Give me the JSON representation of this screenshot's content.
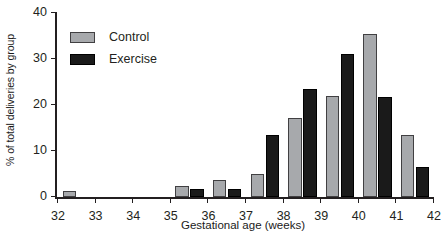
{
  "chart_data": {
    "type": "bar",
    "title": "",
    "subtitle": "",
    "xlabel": "Gestational age (weeks)",
    "ylabel": "% of total deliveries by group",
    "categories": [
      "32",
      "33",
      "34",
      "35",
      "36",
      "37",
      "38",
      "39",
      "40",
      "41"
    ],
    "x_tick_labels": [
      "32",
      "33",
      "34",
      "35",
      "36",
      "37",
      "38",
      "39",
      "40",
      "41",
      "42"
    ],
    "y_tick_labels": [
      "0",
      "10",
      "20",
      "30",
      "40"
    ],
    "y_ticks": [
      0,
      10,
      20,
      30,
      40
    ],
    "ylim": [
      0,
      40
    ],
    "xlim": [
      32,
      42
    ],
    "grid": false,
    "legend_position": "upper left",
    "series": [
      {
        "name": "Control",
        "color": "#a7a9ac",
        "values": [
          1.3,
          0,
          0,
          2.3,
          3.7,
          4.9,
          17.1,
          22.0,
          35.5,
          13.4
        ]
      },
      {
        "name": "Exercise",
        "color": "#1a1a1a",
        "values": [
          0,
          0,
          0,
          1.7,
          1.7,
          13.5,
          23.5,
          31.0,
          21.8,
          6.5
        ]
      }
    ]
  },
  "legend": {
    "items": [
      {
        "label": "Control",
        "color": "#a7a9ac"
      },
      {
        "label": "Exercise",
        "color": "#1a1a1a"
      }
    ]
  },
  "axes": {
    "x_title": "Gestational age (weeks)",
    "y_title": "% of total deliveries by group"
  }
}
